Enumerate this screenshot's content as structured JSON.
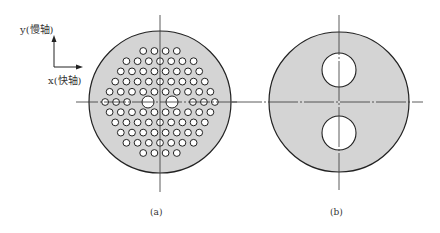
{
  "figure": {
    "axes_legend": {
      "y_label": "y(慢轴)",
      "x_label": "x(快轴)"
    },
    "panel_a": {
      "caption": "(a)",
      "description": "Photonic crystal fiber cross-section with hexagonal array of small air holes and two large air holes along x-axis",
      "row_counts": [
        4,
        7,
        8,
        9,
        10,
        8,
        10,
        9,
        8,
        7,
        4
      ]
    },
    "panel_b": {
      "caption": "(b)",
      "description": "Fiber cross-section with two large air holes along y-axis"
    },
    "colors": {
      "fill": "#d4d4d4",
      "stroke": "#222222",
      "hole": "#ffffff"
    }
  }
}
